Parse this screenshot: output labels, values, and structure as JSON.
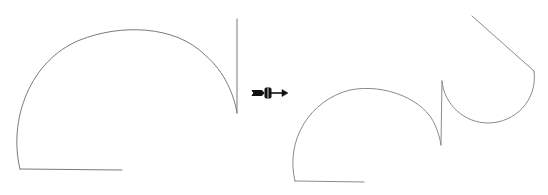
{
  "diagram": {
    "type": "geometric-transformation",
    "stroke_color": "#7a7a7a",
    "arrow_color": "#111111",
    "background": "#ffffff",
    "before_shape": {
      "label": "",
      "segments": [
        {
          "kind": "line",
          "from": [
            20,
            169
          ],
          "to": [
            122,
            170
          ]
        },
        {
          "kind": "arc",
          "from": [
            20,
            169
          ],
          "through_top": [
            125,
            30
          ],
          "to": [
            237,
            113
          ]
        },
        {
          "kind": "line",
          "from": [
            237,
            113
          ],
          "to": [
            237,
            19
          ]
        }
      ]
    },
    "after_shape": {
      "label": "",
      "segments": [
        {
          "kind": "line",
          "from": [
            295,
            181
          ],
          "to": [
            364,
            182
          ]
        },
        {
          "kind": "arc",
          "from": [
            295,
            181
          ],
          "through_top": [
            367,
            88
          ],
          "to": [
            441,
            145
          ]
        },
        {
          "kind": "line",
          "from": [
            441,
            145
          ],
          "to": [
            442,
            81
          ]
        },
        {
          "kind": "arc",
          "from": [
            442,
            81
          ],
          "through_bottom": [
            488,
            123
          ],
          "to": [
            534,
            71
          ]
        },
        {
          "kind": "line",
          "from": [
            534,
            71
          ],
          "to": [
            472,
            16
          ]
        }
      ]
    },
    "transition_arrow": {
      "icon": "transform-arrow-icon",
      "from": [
        252,
        93
      ],
      "to": [
        287,
        93
      ]
    }
  }
}
